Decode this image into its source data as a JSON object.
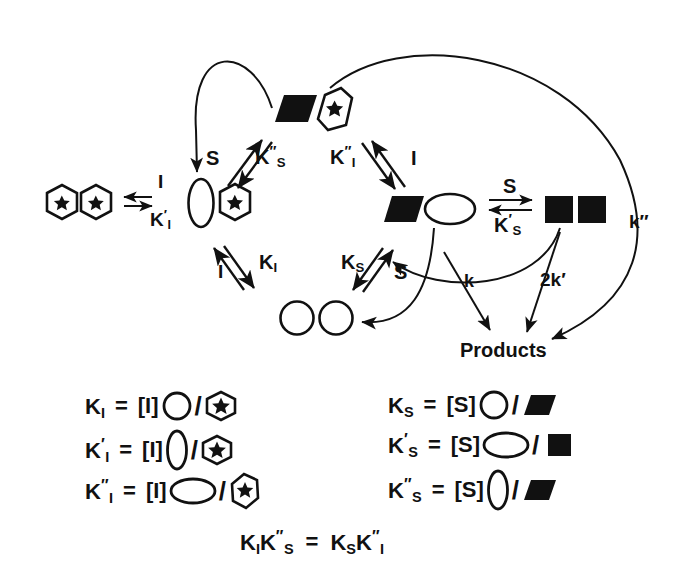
{
  "figure": {
    "kind": "enzyme-kinetics-scheme",
    "stroke_color": "#111111",
    "fill_black": "#000000",
    "background": "#ffffff"
  },
  "species": {
    "free_dimer": {
      "name": "free-enzyme-dimer",
      "parts": [
        "hexagon-star",
        "hexagon-star"
      ]
    },
    "one_inhibitor_dimer": {
      "name": "enzyme-inhibitor-complex",
      "parts": [
        "ellipse-tall",
        "hexagon-star"
      ]
    },
    "top_complex": {
      "name": "substrate-inhibitor-complex",
      "parts": [
        "parallelogram-black",
        "hexagon-star-tall"
      ]
    },
    "substrate_dimer_left": {
      "name": "enzyme-substrate-complex",
      "parts": [
        "parallelogram-black",
        "ellipse-wide"
      ]
    },
    "substrate_dimer_right": {
      "name": "doubly-liganded-complex",
      "parts": [
        "square-black",
        "square-black"
      ]
    },
    "relaxed_dimer": {
      "name": "relaxed-dimer",
      "parts": [
        "circle",
        "circle"
      ]
    }
  },
  "equilibria": {
    "left": {
      "name": "Ki-prime-equilibrium",
      "top_label": "I",
      "bottom_label_base": "K",
      "bottom_label_prime": "′",
      "bottom_label_sub": "I"
    },
    "upper_left": {
      "name": "Ks-double-prime-equilibrium",
      "left_label": "S",
      "right_base": "K",
      "right_primes": "″",
      "right_sub": "S"
    },
    "upper_right": {
      "name": "Ki-double-prime-equilibrium",
      "left_base": "K",
      "left_primes": "″",
      "left_sub": "I",
      "right_label": "I"
    },
    "lower_left": {
      "name": "Ki-equilibrium",
      "left_label": "I",
      "right_base": "K",
      "right_sub": "I"
    },
    "lower_right": {
      "name": "Ks-equilibrium",
      "left_base": "K",
      "left_sub": "S",
      "right_label": "S"
    },
    "middle_right": {
      "name": "Ks-prime-equilibrium",
      "top_label": "S",
      "bottom_base": "K",
      "bottom_prime": "′",
      "bottom_sub": "S"
    }
  },
  "rate_constants": {
    "k": {
      "name": "rate-k",
      "label": "k"
    },
    "two_k_prime": {
      "name": "rate-2k-prime",
      "label": "2k′"
    },
    "k_double_prime": {
      "name": "rate-k-double-prime",
      "label": "k″"
    }
  },
  "products": {
    "name": "products-label",
    "label": "Products"
  },
  "definitions": {
    "left_column": [
      {
        "name": "Ki-definition",
        "lhs_base": "K",
        "lhs_primes": "",
        "lhs_sub": "I",
        "eq": "=",
        "bracket": "[I]",
        "numerator_glyph": "circle",
        "slash": "/",
        "denominator_glyph": "hexagon-star"
      },
      {
        "name": "Ki-prime-definition",
        "lhs_base": "K",
        "lhs_primes": "′",
        "lhs_sub": "I",
        "eq": "=",
        "bracket": "[I]",
        "numerator_glyph": "ellipse-tall",
        "slash": "/",
        "denominator_glyph": "hexagon-star"
      },
      {
        "name": "Ki-double-prime-definition",
        "lhs_base": "K",
        "lhs_primes": "″",
        "lhs_sub": "I",
        "eq": "=",
        "bracket": "[I]",
        "numerator_glyph": "ellipse-wide",
        "slash": "/",
        "denominator_glyph": "hexagon-star-tall"
      }
    ],
    "right_column": [
      {
        "name": "Ks-definition",
        "lhs_base": "K",
        "lhs_primes": "",
        "lhs_sub": "S",
        "eq": "=",
        "bracket": "[S]",
        "numerator_glyph": "circle",
        "slash": "/",
        "denominator_glyph": "parallelogram-black"
      },
      {
        "name": "Ks-prime-definition",
        "lhs_base": "K",
        "lhs_primes": "′",
        "lhs_sub": "S",
        "eq": "=",
        "bracket": "[S]",
        "numerator_glyph": "ellipse-wide",
        "slash": "/",
        "denominator_glyph": "square-black"
      },
      {
        "name": "Ks-double-prime-definition",
        "lhs_base": "K",
        "lhs_primes": "″",
        "lhs_sub": "S",
        "eq": "=",
        "bracket": "[S]",
        "numerator_glyph": "ellipse-tall",
        "slash": "/",
        "denominator_glyph": "parallelogram-black"
      }
    ],
    "identity": {
      "name": "thermodynamic-box-identity",
      "left": {
        "a_base": "K",
        "a_sub": "I",
        "b_base": "K",
        "b_primes": "″",
        "b_sub": "S"
      },
      "eq": "=",
      "right": {
        "a_base": "K",
        "a_sub": "S",
        "b_base": "K",
        "b_primes": "″",
        "b_sub": "I"
      }
    }
  }
}
